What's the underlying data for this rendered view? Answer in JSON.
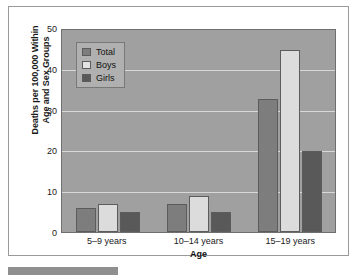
{
  "chart_data": {
    "type": "bar",
    "title": "",
    "xlabel": "Age",
    "ylabel": "Deaths per 100,000 Within Age and Sex Groups",
    "ylabel_lines": [
      "Deaths per 100,000 Within",
      "Age and Sex Groups"
    ],
    "categories": [
      "5–9 years",
      "10–14 years",
      "15–19 years"
    ],
    "series": [
      {
        "name": "Total",
        "values": [
          6,
          7,
          33
        ],
        "color": "#7d7d7d"
      },
      {
        "name": "Boys",
        "values": [
          7,
          9,
          45
        ],
        "color": "#dcdcdc"
      },
      {
        "name": "Girls",
        "values": [
          5,
          5,
          20
        ],
        "color": "#595959"
      }
    ],
    "ylim": [
      0,
      50
    ],
    "yticks": [
      0,
      10,
      20,
      30,
      40,
      50
    ],
    "ytick_labels": [
      "0",
      "10",
      "20",
      "30",
      "40",
      "50"
    ],
    "grid": true,
    "legend_position": "top-left",
    "plot_background": "#a0a0a0",
    "gridline_color": "#d8d8d8"
  },
  "legend": {
    "items": [
      {
        "label": "Total"
      },
      {
        "label": "Boys"
      },
      {
        "label": "Girls"
      }
    ]
  }
}
